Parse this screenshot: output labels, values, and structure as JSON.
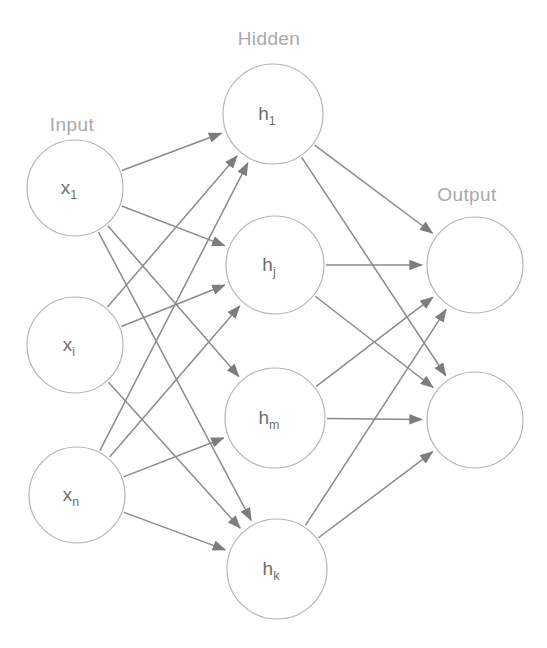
{
  "diagram": {
    "background_color": "#ffffff",
    "edge_color": "#8b8b8b",
    "node_stroke_color": "#b4b4b4",
    "node_fill_color": "#ffffff",
    "node_label_color": "#6e6e6e",
    "layer_label_color": "#a9a9a9"
  },
  "layers": [
    {
      "id": "input",
      "label": "Input",
      "label_x": 72,
      "label_y": 131,
      "nodes": [
        {
          "id": "x1",
          "base": "x",
          "sub": "1",
          "cx": 75,
          "cy": 188,
          "r": 48
        },
        {
          "id": "xi",
          "base": "x",
          "sub": "i",
          "cx": 75,
          "cy": 345,
          "r": 48
        },
        {
          "id": "xn",
          "base": "x",
          "sub": "n",
          "cx": 77,
          "cy": 495,
          "r": 48
        }
      ]
    },
    {
      "id": "hidden",
      "label": "Hidden",
      "label_x": 269,
      "label_y": 45,
      "nodes": [
        {
          "id": "h1",
          "base": "h",
          "sub": "1",
          "cx": 273,
          "cy": 114,
          "r": 50
        },
        {
          "id": "hj",
          "base": "h",
          "sub": "j",
          "cx": 275,
          "cy": 265,
          "r": 49
        },
        {
          "id": "hm",
          "base": "h",
          "sub": "m",
          "cx": 275,
          "cy": 418,
          "r": 50
        },
        {
          "id": "hk",
          "base": "h",
          "sub": "k",
          "cx": 277,
          "cy": 569,
          "r": 50
        }
      ]
    },
    {
      "id": "output",
      "label": "Output",
      "label_x": 467,
      "label_y": 201,
      "nodes": [
        {
          "id": "o1",
          "base": "",
          "sub": "",
          "cx": 475,
          "cy": 265,
          "r": 48
        },
        {
          "id": "o2",
          "base": "",
          "sub": "",
          "cx": 475,
          "cy": 420,
          "r": 48
        }
      ]
    }
  ],
  "edges": [
    {
      "from": "x1",
      "to": "h1"
    },
    {
      "from": "x1",
      "to": "hj"
    },
    {
      "from": "x1",
      "to": "hm"
    },
    {
      "from": "x1",
      "to": "hk"
    },
    {
      "from": "xi",
      "to": "h1"
    },
    {
      "from": "xi",
      "to": "hj"
    },
    {
      "from": "xi",
      "to": "hk"
    },
    {
      "from": "xn",
      "to": "h1"
    },
    {
      "from": "xn",
      "to": "hj"
    },
    {
      "from": "xn",
      "to": "hm"
    },
    {
      "from": "xn",
      "to": "hk"
    },
    {
      "from": "h1",
      "to": "o1"
    },
    {
      "from": "h1",
      "to": "o2"
    },
    {
      "from": "hj",
      "to": "o1"
    },
    {
      "from": "hj",
      "to": "o2"
    },
    {
      "from": "hm",
      "to": "o1"
    },
    {
      "from": "hm",
      "to": "o2"
    },
    {
      "from": "hk",
      "to": "o1"
    },
    {
      "from": "hk",
      "to": "o2"
    }
  ]
}
